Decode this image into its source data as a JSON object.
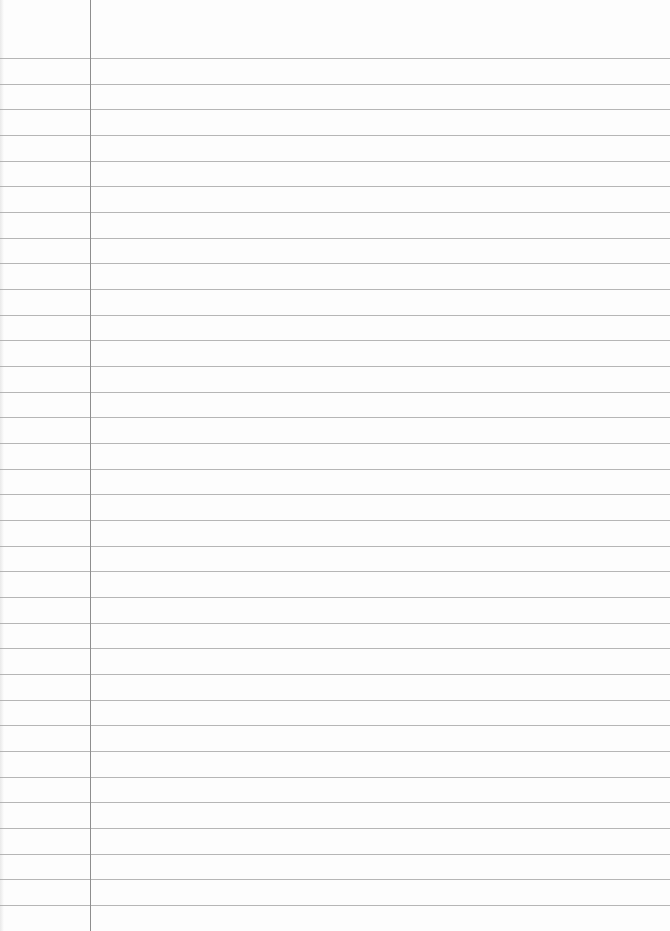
{
  "paper": {
    "type": "lined notebook paper",
    "width": 670,
    "height": 931,
    "margin_line_x": 90,
    "first_rule_y": 58,
    "rule_spacing": 25.67,
    "rule_count": 34,
    "colors": {
      "background": "#fdfdfd",
      "rule": "#a9a9a9",
      "margin": "#8e8e8e"
    }
  }
}
